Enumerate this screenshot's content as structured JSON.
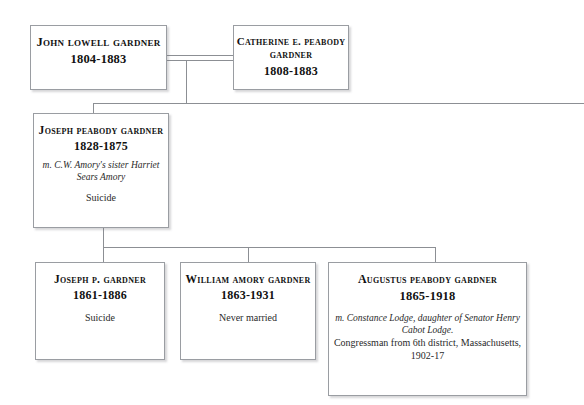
{
  "chart_title": "Gardner family genealogical tree",
  "nodes": {
    "john_lowell_gardner": {
      "name": "John Lowell Gardner",
      "dates": "1804-1883"
    },
    "catherine_peabody_gardner": {
      "name": "Catherine E. Peabody Gardner",
      "dates": "1808-1883"
    },
    "joseph_peabody_gardner": {
      "name": "Joseph Peabody Gardner",
      "dates": "1828-1875",
      "marriage_note": "m. C.W. Amory's sister Harriet Sears Amory",
      "fate": "Suicide"
    },
    "joseph_p_gardner": {
      "name": "Joseph P. Gardner",
      "dates": "1861-1886",
      "fate": "Suicide"
    },
    "william_amory_gardner": {
      "name": "William Amory Gardner",
      "dates": "1863-1931",
      "fate": "Never married"
    },
    "augustus_peabody_gardner": {
      "name": "Augustus Peabody Gardner",
      "dates": "1865-1918",
      "marriage_note": "m. Constance Lodge, daughter of Senator Henry Cabot Lodge.",
      "office": "Congressman from 6th district, Massachusetts, 1902-17"
    }
  },
  "colors": {
    "background": "#ffffff",
    "box_border": "#9a9da2",
    "connector_line": "#8c8f94",
    "text": "#111111"
  }
}
